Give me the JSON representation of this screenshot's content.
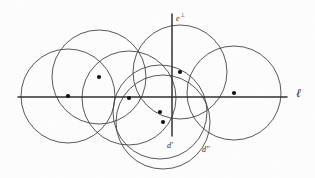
{
  "figure": {
    "background_color": "#fdfdfd",
    "stroke_color": "#3a3a3a",
    "axis_color": "#2f2f2f",
    "point_color": "#111111",
    "width": 315,
    "height": 178
  },
  "labels": {
    "e_perp": "e",
    "e_perp_sup": "⊥",
    "line_ell": "ℓ",
    "d_prime": "d'",
    "d_double_prime": "d''"
  },
  "chart_data": {
    "type": "scatter",
    "xlabel": "",
    "ylabel": "",
    "xlim": [
      0,
      315
    ],
    "ylim": [
      0,
      178
    ],
    "grid": false,
    "legend": "none",
    "axes": [
      {
        "name": "line-ell",
        "orientation": "horizontal",
        "x1": 18,
        "y1": 97,
        "x2": 287,
        "y2": 97,
        "label": "ℓ",
        "label_x": 296,
        "label_y": 93
      },
      {
        "name": "axis-e-perp",
        "orientation": "vertical",
        "x1": 172,
        "y1": 14,
        "x2": 172,
        "y2": 136,
        "label": "e⊥",
        "label_x": 176,
        "label_y": 16
      }
    ],
    "circles": [
      {
        "name": "circle-1-far-left",
        "cx": 68,
        "cy": 96,
        "r": 47
      },
      {
        "name": "circle-2-upper-left",
        "cx": 99,
        "cy": 77,
        "r": 47
      },
      {
        "name": "circle-3-mid-left",
        "cx": 129,
        "cy": 98,
        "r": 47
      },
      {
        "name": "circle-4-upper-mid",
        "cx": 180,
        "cy": 72,
        "r": 47
      },
      {
        "name": "circle-5-far-right",
        "cx": 234,
        "cy": 93,
        "r": 47
      },
      {
        "name": "circle-6-d-prime",
        "cx": 160,
        "cy": 112,
        "r": 47
      },
      {
        "name": "circle-7-d-dprime",
        "cx": 163,
        "cy": 122,
        "r": 47
      }
    ],
    "points": [
      {
        "name": "center-1",
        "x": 68,
        "y": 96,
        "label": ""
      },
      {
        "name": "center-2",
        "x": 99,
        "y": 77,
        "label": ""
      },
      {
        "name": "center-3",
        "x": 129,
        "y": 98,
        "label": ""
      },
      {
        "name": "center-4",
        "x": 180,
        "y": 72,
        "label": ""
      },
      {
        "name": "center-5",
        "x": 234,
        "y": 93,
        "label": ""
      },
      {
        "name": "center-6",
        "x": 160,
        "y": 112,
        "label": "d'"
      },
      {
        "name": "center-7",
        "x": 163,
        "y": 122,
        "label": "d''"
      }
    ],
    "annotations": [
      {
        "name": "annotation-d-prime",
        "text": "d'",
        "x": 167,
        "y": 146
      },
      {
        "name": "annotation-d-dprime",
        "text": "d''",
        "x": 202,
        "y": 150
      },
      {
        "name": "annotation-e-perp",
        "text": "e⊥",
        "x": 176,
        "y": 18
      },
      {
        "name": "annotation-ell",
        "text": "ℓ",
        "x": 296,
        "y": 94
      }
    ]
  }
}
